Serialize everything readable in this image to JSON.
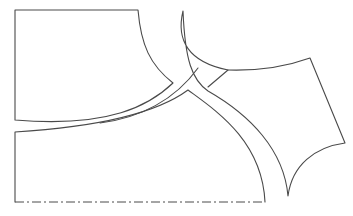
{
  "diagram": {
    "type": "sewing-pattern",
    "stroke_color": "#4a4a4a",
    "background": "#ffffff",
    "pieces": [
      {
        "id": "upper-left-panel",
        "description": "Upper left pattern piece with rectangular left/top edges and curved right and bottom edges"
      },
      {
        "id": "lower-left-panel",
        "description": "Lower left pattern piece with fold line along bottom"
      },
      {
        "id": "right-panel",
        "description": "Right pattern piece with pointed top and bottom tips"
      },
      {
        "id": "center-strip",
        "description": "Curved strip between pieces"
      }
    ],
    "lines": {
      "fold_line": "dash-dot fold line along bottom edge"
    }
  }
}
